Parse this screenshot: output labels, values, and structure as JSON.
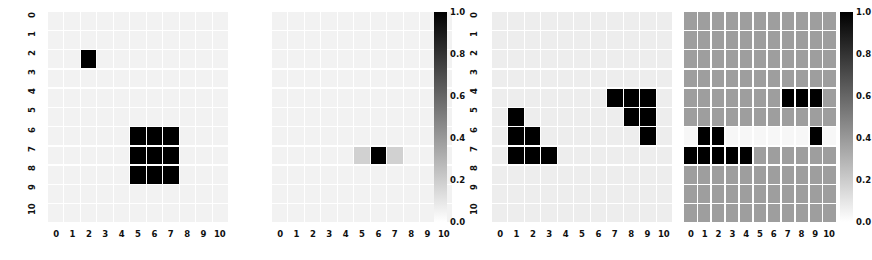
{
  "figure": {
    "type": "heatmap-grid-figure",
    "panel_count": 4,
    "colormap": "Greys",
    "grid_size": 11,
    "background_hex": "#ffffff",
    "gridline_hex": "#ffffff"
  },
  "axis": {
    "x_tick_labels": [
      "0",
      "1",
      "2",
      "3",
      "4",
      "5",
      "6",
      "7",
      "8",
      "9",
      "10"
    ],
    "y_tick_labels": [
      "0",
      "1",
      "2",
      "3",
      "4",
      "5",
      "6",
      "7",
      "8",
      "9",
      "10"
    ]
  },
  "colorbar": {
    "tick_labels": [
      "0.0",
      "0.2",
      "0.4",
      "0.6",
      "0.8",
      "1.0"
    ],
    "tick_values": [
      0.0,
      0.2,
      0.4,
      0.6,
      0.8,
      1.0
    ],
    "vmin": 0.0,
    "vmax": 1.0,
    "low_hex": "#ffffff",
    "high_hex": "#000000"
  },
  "chart_data": {
    "type": "heatmap",
    "title": "",
    "xlabel": "",
    "ylabel": "",
    "colormap": "Greys",
    "vmin": 0.0,
    "vmax": 1.0,
    "xlim": [
      0,
      10
    ],
    "ylim": [
      10,
      0
    ],
    "grid": true,
    "legend_position": "right-colorbar",
    "panels": [
      {
        "name": "panel-1",
        "has_colorbar": false,
        "has_ytick_labels": true,
        "background_value": 0.05,
        "values": [
          [
            0.05,
            0.05,
            0.05,
            0.05,
            0.05,
            0.05,
            0.05,
            0.05,
            0.05,
            0.05,
            0.05
          ],
          [
            0.05,
            0.05,
            0.05,
            0.05,
            0.05,
            0.05,
            0.05,
            0.05,
            0.05,
            0.05,
            0.05
          ],
          [
            0.05,
            0.05,
            1.0,
            0.05,
            0.05,
            0.05,
            0.05,
            0.05,
            0.05,
            0.05,
            0.05
          ],
          [
            0.05,
            0.05,
            0.05,
            0.05,
            0.05,
            0.05,
            0.05,
            0.05,
            0.05,
            0.05,
            0.05
          ],
          [
            0.05,
            0.05,
            0.05,
            0.05,
            0.05,
            0.05,
            0.05,
            0.05,
            0.05,
            0.05,
            0.05
          ],
          [
            0.05,
            0.05,
            0.05,
            0.05,
            0.05,
            0.05,
            0.05,
            0.05,
            0.05,
            0.05,
            0.05
          ],
          [
            0.05,
            0.05,
            0.05,
            0.05,
            0.05,
            1.0,
            1.0,
            1.0,
            0.05,
            0.05,
            0.05
          ],
          [
            0.05,
            0.05,
            0.05,
            0.05,
            0.05,
            1.0,
            1.0,
            1.0,
            0.05,
            0.05,
            0.05
          ],
          [
            0.05,
            0.05,
            0.05,
            0.05,
            0.05,
            1.0,
            1.0,
            1.0,
            0.05,
            0.05,
            0.05
          ],
          [
            0.05,
            0.05,
            0.05,
            0.05,
            0.05,
            0.05,
            0.05,
            0.05,
            0.05,
            0.05,
            0.05
          ],
          [
            0.05,
            0.05,
            0.05,
            0.05,
            0.05,
            0.05,
            0.05,
            0.05,
            0.05,
            0.05,
            0.05
          ]
        ]
      },
      {
        "name": "panel-2",
        "has_colorbar": true,
        "has_ytick_labels": false,
        "background_value": 0.05,
        "values": [
          [
            0.05,
            0.05,
            0.05,
            0.05,
            0.05,
            0.05,
            0.05,
            0.05,
            0.05,
            0.05,
            0.05
          ],
          [
            0.05,
            0.05,
            0.05,
            0.05,
            0.05,
            0.05,
            0.05,
            0.05,
            0.05,
            0.05,
            0.05
          ],
          [
            0.05,
            0.05,
            0.05,
            0.05,
            0.05,
            0.05,
            0.05,
            0.05,
            0.05,
            0.05,
            0.05
          ],
          [
            0.05,
            0.05,
            0.05,
            0.05,
            0.05,
            0.05,
            0.05,
            0.05,
            0.05,
            0.05,
            0.05
          ],
          [
            0.05,
            0.05,
            0.05,
            0.05,
            0.05,
            0.05,
            0.05,
            0.05,
            0.05,
            0.05,
            0.05
          ],
          [
            0.05,
            0.05,
            0.05,
            0.05,
            0.05,
            0.05,
            0.05,
            0.05,
            0.05,
            0.05,
            0.05
          ],
          [
            0.05,
            0.05,
            0.05,
            0.05,
            0.05,
            0.05,
            0.05,
            0.05,
            0.05,
            0.05,
            0.05
          ],
          [
            0.05,
            0.05,
            0.05,
            0.05,
            0.05,
            0.18,
            1.0,
            0.18,
            0.05,
            0.05,
            0.05
          ],
          [
            0.05,
            0.05,
            0.05,
            0.05,
            0.05,
            0.05,
            0.05,
            0.05,
            0.05,
            0.05,
            0.05
          ],
          [
            0.05,
            0.05,
            0.05,
            0.05,
            0.05,
            0.05,
            0.05,
            0.05,
            0.05,
            0.05,
            0.05
          ],
          [
            0.05,
            0.05,
            0.05,
            0.05,
            0.05,
            0.05,
            0.05,
            0.05,
            0.05,
            0.05,
            0.05
          ]
        ]
      },
      {
        "name": "panel-3",
        "has_colorbar": false,
        "has_ytick_labels": true,
        "background_value": 0.07,
        "values": [
          [
            0.07,
            0.07,
            0.07,
            0.07,
            0.07,
            0.07,
            0.07,
            0.07,
            0.07,
            0.07,
            0.07
          ],
          [
            0.07,
            0.07,
            0.07,
            0.07,
            0.07,
            0.07,
            0.07,
            0.07,
            0.07,
            0.07,
            0.07
          ],
          [
            0.07,
            0.07,
            0.07,
            0.07,
            0.07,
            0.07,
            0.07,
            0.07,
            0.07,
            0.07,
            0.07
          ],
          [
            0.07,
            0.07,
            0.07,
            0.07,
            0.07,
            0.07,
            0.07,
            0.07,
            0.07,
            0.07,
            0.07
          ],
          [
            0.07,
            0.07,
            0.07,
            0.07,
            0.07,
            0.07,
            0.07,
            1.0,
            1.0,
            1.0,
            0.07
          ],
          [
            0.07,
            1.0,
            0.07,
            0.07,
            0.07,
            0.07,
            0.07,
            0.07,
            1.0,
            1.0,
            0.07
          ],
          [
            0.07,
            1.0,
            1.0,
            0.07,
            0.07,
            0.07,
            0.07,
            0.07,
            0.07,
            1.0,
            0.07
          ],
          [
            0.07,
            1.0,
            1.0,
            1.0,
            0.07,
            0.07,
            0.07,
            0.07,
            0.07,
            0.07,
            0.07
          ],
          [
            0.07,
            0.07,
            0.07,
            0.07,
            0.07,
            0.07,
            0.07,
            0.07,
            0.07,
            0.07,
            0.07
          ],
          [
            0.07,
            0.07,
            0.07,
            0.07,
            0.07,
            0.07,
            0.07,
            0.07,
            0.07,
            0.07,
            0.07
          ],
          [
            0.07,
            0.07,
            0.07,
            0.07,
            0.07,
            0.07,
            0.07,
            0.07,
            0.07,
            0.07,
            0.07
          ]
        ]
      },
      {
        "name": "panel-4",
        "has_colorbar": true,
        "has_ytick_labels": false,
        "background_value": 0.38,
        "values": [
          [
            0.38,
            0.38,
            0.38,
            0.38,
            0.38,
            0.38,
            0.38,
            0.38,
            0.38,
            0.38,
            0.38
          ],
          [
            0.38,
            0.38,
            0.38,
            0.38,
            0.38,
            0.38,
            0.38,
            0.38,
            0.38,
            0.38,
            0.38
          ],
          [
            0.38,
            0.38,
            0.38,
            0.38,
            0.38,
            0.38,
            0.38,
            0.38,
            0.38,
            0.38,
            0.38
          ],
          [
            0.38,
            0.38,
            0.38,
            0.38,
            0.38,
            0.38,
            0.38,
            0.38,
            0.38,
            0.38,
            0.38
          ],
          [
            0.38,
            0.38,
            0.38,
            0.38,
            0.38,
            0.38,
            0.38,
            1.0,
            1.0,
            1.0,
            0.38
          ],
          [
            0.38,
            0.38,
            0.38,
            0.38,
            0.38,
            0.38,
            0.38,
            0.38,
            0.38,
            0.38,
            0.38
          ],
          [
            0.03,
            1.0,
            1.0,
            0.03,
            0.03,
            0.03,
            0.03,
            0.03,
            0.03,
            1.0,
            0.03
          ],
          [
            1.0,
            1.0,
            1.0,
            1.0,
            1.0,
            0.38,
            0.38,
            0.38,
            0.38,
            0.38,
            0.38
          ],
          [
            0.38,
            0.38,
            0.38,
            0.38,
            0.38,
            0.38,
            0.38,
            0.38,
            0.38,
            0.38,
            0.38
          ],
          [
            0.38,
            0.38,
            0.38,
            0.38,
            0.38,
            0.38,
            0.38,
            0.38,
            0.38,
            0.38,
            0.38
          ],
          [
            0.38,
            0.38,
            0.38,
            0.38,
            0.38,
            0.38,
            0.38,
            0.38,
            0.38,
            0.38,
            0.38
          ]
        ]
      }
    ]
  }
}
